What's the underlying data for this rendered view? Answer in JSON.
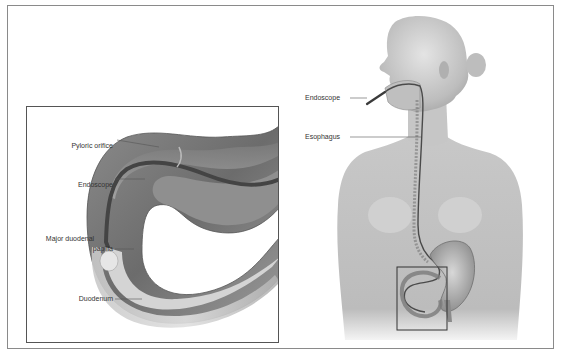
{
  "figure": {
    "inset": {
      "labels": [
        {
          "id": "pyloric-orifice",
          "text": "Pyloric orifice"
        },
        {
          "id": "endoscope",
          "text": "Endoscope"
        },
        {
          "id": "major-duodenal-papilla",
          "line1": "Major duodenal",
          "line2": "papilla"
        },
        {
          "id": "duodenum",
          "text": "Duodenum"
        }
      ]
    },
    "body": {
      "labels": [
        {
          "id": "endoscope",
          "text": "Endoscope"
        },
        {
          "id": "esophagus",
          "text": "Esophagus"
        }
      ]
    }
  },
  "colors": {
    "frame": "#8a8a8a",
    "inset_frame": "#555555",
    "skin_light": "#d9d9d9",
    "skin_mid": "#b8b8b8",
    "tissue_dark": "#6e6e6e",
    "endoscope": "#3a3a3a",
    "label_text": "#333333"
  }
}
